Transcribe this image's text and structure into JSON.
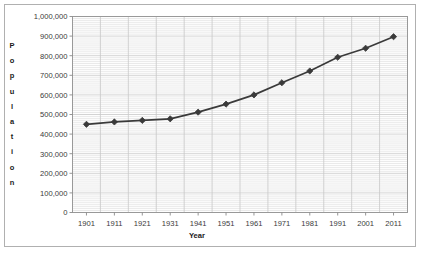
{
  "chart_data": {
    "type": "line",
    "title": "",
    "xlabel": "Year",
    "ylabel": "Population",
    "ylabel_letters": [
      "P",
      "o",
      "p",
      "u",
      "l",
      "a",
      "t",
      "i",
      "o",
      "n"
    ],
    "categories": [
      "1901",
      "1911",
      "1921",
      "1931",
      "1941",
      "1951",
      "1961",
      "1971",
      "1981",
      "1991",
      "2001",
      "2011"
    ],
    "x": [
      1901,
      1911,
      1921,
      1931,
      1941,
      1951,
      1961,
      1971,
      1981,
      1991,
      2001,
      2011
    ],
    "values": [
      450000,
      462000,
      470000,
      478000,
      512000,
      553000,
      600000,
      662000,
      722000,
      792000,
      838000,
      897000
    ],
    "ylim": [
      0,
      1000000
    ],
    "ytick_values": [
      0,
      100000,
      200000,
      300000,
      400000,
      500000,
      600000,
      700000,
      800000,
      900000,
      1000000
    ],
    "ytick_labels": [
      "0",
      "100,000",
      "200,000",
      "300,000",
      "400,000",
      "500,000",
      "600,000",
      "700,000",
      "800,000",
      "900,000",
      "1,000,000"
    ],
    "grid": "major and minor horizontal, major vertical",
    "legend": "none",
    "series_color": "#3a3a3a",
    "marker": "diamond",
    "gridline_color": "#c8c8c8",
    "minor_gridline_color": "#dcdcdc",
    "plot_border_color": "#999999"
  },
  "figure": {
    "background_color": "#ffffff",
    "border_color": "#b0b0b0"
  }
}
